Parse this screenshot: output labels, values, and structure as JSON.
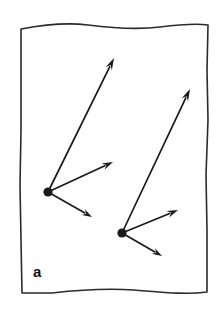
{
  "figure": {
    "domain": "Diagram",
    "panel_label": "a",
    "canvas": {
      "width": 223,
      "height": 309
    },
    "colors": {
      "background": "#ffffff",
      "ink": "#1a1a1a",
      "frame": "#2b2b2b",
      "label": "#111111"
    },
    "frame": {
      "name": "hand-drawn-border",
      "stroke_width": 1.6,
      "path": "M 21,29 C 42,25 64,22 88,25 C 112,28 136,30 160,27 C 176,25 194,23 208,25 L 207,70 L 208,120 L 206,175 L 207,230 L 207,292 C 186,295 160,292 134,290 C 106,288 78,290 52,293 L 22,293 L 21,240 L 20,185 L 21,130 L 21,80 Z"
    },
    "vertices": [
      {
        "name": "vertex-left",
        "cx": 48,
        "cy": 192,
        "r": 4.6,
        "label": "left vertex"
      },
      {
        "name": "vertex-right",
        "cx": 122,
        "cy": 233,
        "r": 4.6,
        "label": "right vertex"
      }
    ],
    "arrows": [
      {
        "name": "arrow-left-long-up",
        "from_vertex": "vertex-left",
        "x1": 48,
        "y1": 192,
        "x2": 114,
        "y2": 58,
        "stroke_width": 1.7,
        "head_length": 12,
        "head_width": 7
      },
      {
        "name": "arrow-left-mid-upright",
        "from_vertex": "vertex-left",
        "x1": 48,
        "y1": 192,
        "x2": 113,
        "y2": 162,
        "stroke_width": 1.7,
        "head_length": 11,
        "head_width": 7
      },
      {
        "name": "arrow-left-downright",
        "from_vertex": "vertex-left",
        "x1": 48,
        "y1": 192,
        "x2": 92,
        "y2": 217,
        "stroke_width": 1.7,
        "head_length": 10,
        "head_width": 6.5
      },
      {
        "name": "arrow-right-long-up",
        "from_vertex": "vertex-right",
        "x1": 122,
        "y1": 233,
        "x2": 190,
        "y2": 89,
        "stroke_width": 1.7,
        "head_length": 12,
        "head_width": 7
      },
      {
        "name": "arrow-right-mid-upright",
        "from_vertex": "vertex-right",
        "x1": 122,
        "y1": 233,
        "x2": 178,
        "y2": 210,
        "stroke_width": 1.7,
        "head_length": 11,
        "head_width": 7
      },
      {
        "name": "arrow-right-downright",
        "from_vertex": "vertex-right",
        "x1": 122,
        "y1": 233,
        "x2": 162,
        "y2": 256,
        "stroke_width": 1.7,
        "head_length": 10,
        "head_width": 6.5
      }
    ],
    "label_position": {
      "x": 33,
      "y": 277
    }
  }
}
